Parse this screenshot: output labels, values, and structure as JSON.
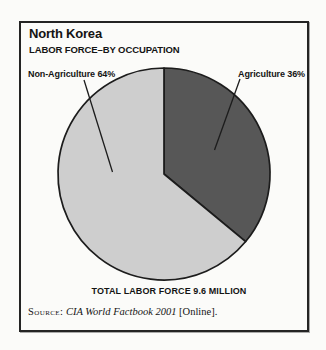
{
  "card": {
    "title": "North Korea",
    "subtitle": "LABOR FORCE–BY OCCUPATION",
    "total_caption": "TOTAL LABOR FORCE 9.6 MILLION",
    "source": {
      "prefix": "Source:",
      "work": " CIA World Factbook 2001",
      "suffix": " [Online]."
    }
  },
  "chart_data": {
    "type": "pie",
    "title": "North Korea",
    "subtitle": "LABOR FORCE–BY OCCUPATION",
    "categories": [
      "Agriculture",
      "Non-Agriculture"
    ],
    "values": [
      36,
      64
    ],
    "unit": "percent",
    "total_note": "TOTAL LABOR FORCE 9.6 MILLION",
    "start_at": "top",
    "direction": "clockwise",
    "outline_color": "#1c1c1c",
    "slices": [
      {
        "name": "Agriculture",
        "value": 36,
        "label": "Agriculture 36%",
        "color": "#575757"
      },
      {
        "name": "Non-Agriculture",
        "value": 64,
        "label": "Non-Agriculture 64%",
        "color": "#cecece"
      }
    ]
  }
}
